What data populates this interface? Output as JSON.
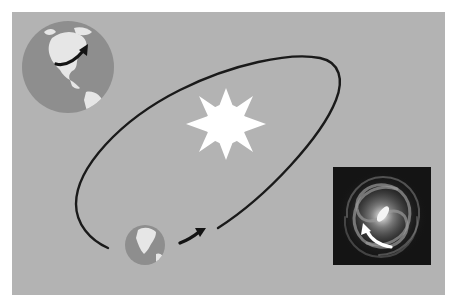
{
  "diagram": {
    "colors": {
      "background": "#b3b3b3",
      "ocean": "#8e8e8e",
      "land": "#e8e8e8",
      "orbit_line": "#1a1a1a",
      "sun": "#ffffff",
      "galaxy_bg": "#141414"
    },
    "elements": [
      {
        "id": "earth-rotation",
        "label": "Earth rotating on its axis (large globe with curved arrow)"
      },
      {
        "id": "sun",
        "label": "Sun (eight-pointed white star)"
      },
      {
        "id": "earth-orbit",
        "label": "Earth's elliptical orbit around the Sun"
      },
      {
        "id": "small-earth",
        "label": "Earth on orbit with direction arrow"
      },
      {
        "id": "galaxy",
        "label": "Spiral galaxy with arrow indicating Sun's motion"
      }
    ]
  }
}
